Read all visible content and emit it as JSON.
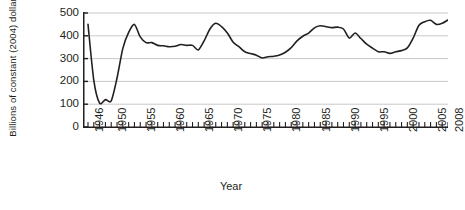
{
  "chart_data": {
    "type": "line",
    "title": "",
    "xlabel": "Year",
    "ylabel": "Billions of constant (2004) dollars",
    "xlim": [
      1946,
      2008
    ],
    "ylim": [
      0,
      500
    ],
    "yticks": [
      0,
      100,
      200,
      300,
      400,
      500
    ],
    "xticks": [
      1946,
      1950,
      1955,
      1960,
      1965,
      1970,
      1975,
      1980,
      1985,
      1990,
      1995,
      2000,
      2005,
      2008
    ],
    "grid": "horizontal",
    "legend": "none",
    "series": [
      {
        "name": "National defense outlays",
        "x": [
          1946,
          1947,
          1948,
          1949,
          1950,
          1951,
          1952,
          1953,
          1954,
          1955,
          1956,
          1957,
          1958,
          1959,
          1960,
          1961,
          1962,
          1963,
          1964,
          1965,
          1966,
          1967,
          1968,
          1969,
          1970,
          1971,
          1972,
          1973,
          1974,
          1975,
          1976,
          1977,
          1978,
          1979,
          1980,
          1981,
          1982,
          1983,
          1984,
          1985,
          1986,
          1987,
          1988,
          1989,
          1990,
          1991,
          1992,
          1993,
          1994,
          1995,
          1996,
          1997,
          1998,
          1999,
          2000,
          2001,
          2002,
          2003,
          2004,
          2005,
          2006,
          2007,
          2008
        ],
        "y": [
          450,
          205,
          105,
          120,
          115,
          215,
          345,
          415,
          450,
          395,
          370,
          370,
          358,
          356,
          352,
          354,
          362,
          358,
          358,
          338,
          378,
          430,
          455,
          440,
          412,
          372,
          352,
          330,
          322,
          315,
          303,
          308,
          310,
          316,
          328,
          348,
          378,
          398,
          412,
          435,
          444,
          440,
          436,
          438,
          430,
          390,
          412,
          388,
          363,
          346,
          330,
          330,
          323,
          330,
          335,
          347,
          390,
          446,
          462,
          468,
          450,
          455,
          470
        ]
      }
    ]
  },
  "axes": {
    "y_title_line1": "Billions of constant",
    "y_title_line2": "(2004) dollars",
    "x_title": "Year"
  },
  "caption": {
    "text": ""
  }
}
